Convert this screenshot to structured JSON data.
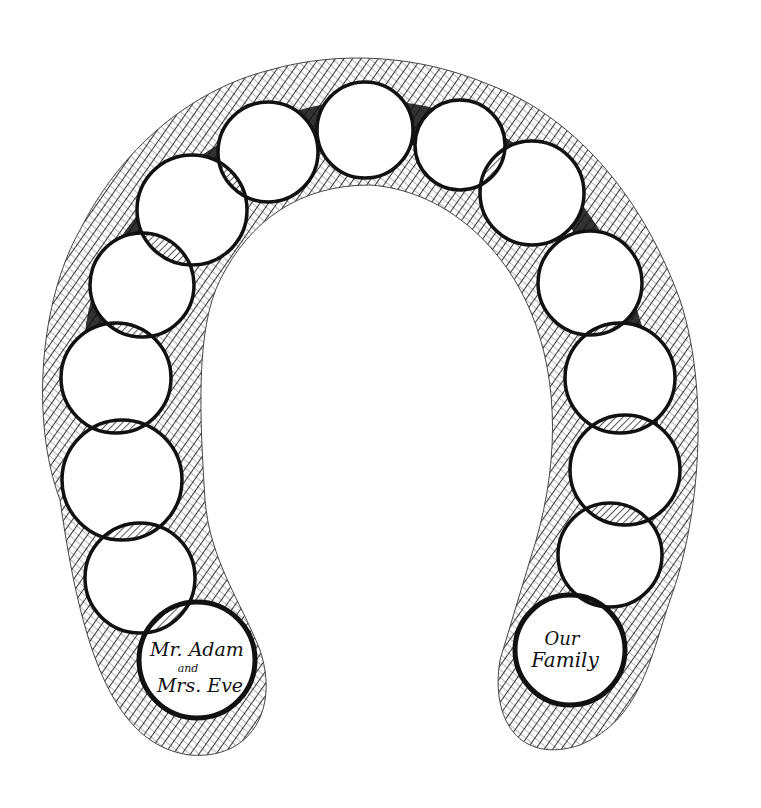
{
  "illustration": {
    "description": "Hand-drawn ink arch (horseshoe) of overlapping circles representing generations, from the first couple to the present family",
    "colors": {
      "ink": "#111111",
      "paper": "#ffffff",
      "hatch": "#222222"
    },
    "start_circle": {
      "line1": "Mr. Adam",
      "line2": "and",
      "line3": "Mrs. Eve"
    },
    "end_circle": {
      "line1": "Our",
      "line2": "Family"
    },
    "circles": [
      {
        "cx": 197,
        "cy": 660,
        "r": 58,
        "role": "start"
      },
      {
        "cx": 140,
        "cy": 578,
        "r": 55
      },
      {
        "cx": 122,
        "cy": 480,
        "r": 60
      },
      {
        "cx": 116,
        "cy": 378,
        "r": 55
      },
      {
        "cx": 142,
        "cy": 285,
        "r": 52
      },
      {
        "cx": 192,
        "cy": 210,
        "r": 55
      },
      {
        "cx": 268,
        "cy": 152,
        "r": 50
      },
      {
        "cx": 365,
        "cy": 130,
        "r": 48
      },
      {
        "cx": 460,
        "cy": 145,
        "r": 45
      },
      {
        "cx": 532,
        "cy": 193,
        "r": 52
      },
      {
        "cx": 590,
        "cy": 283,
        "r": 52
      },
      {
        "cx": 620,
        "cy": 378,
        "r": 55
      },
      {
        "cx": 625,
        "cy": 470,
        "r": 55
      },
      {
        "cx": 610,
        "cy": 555,
        "r": 52
      },
      {
        "cx": 570,
        "cy": 650,
        "r": 55,
        "role": "end"
      }
    ]
  }
}
